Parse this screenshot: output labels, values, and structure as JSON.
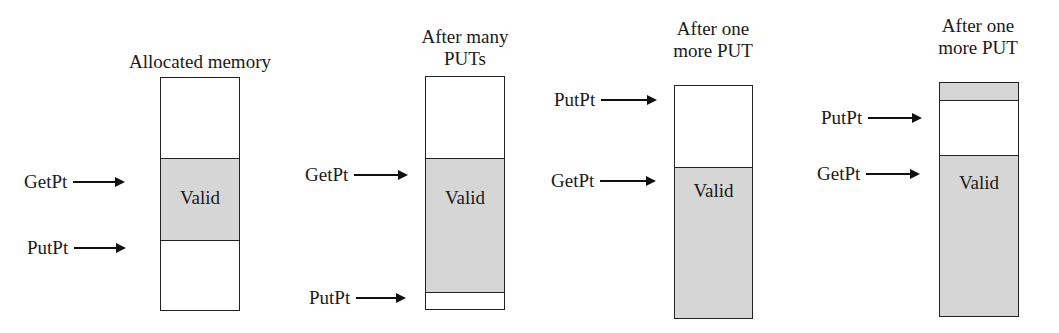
{
  "diagram": {
    "panels": [
      {
        "title": "Allocated memory",
        "segments": [
          {
            "type": "free"
          },
          {
            "type": "valid",
            "label": "Valid"
          },
          {
            "type": "free"
          }
        ],
        "pointers": [
          {
            "label": "GetPt"
          },
          {
            "label": "PutPt"
          }
        ]
      },
      {
        "title_line1": "After many",
        "title_line2": "PUTs",
        "segments": [
          {
            "type": "free"
          },
          {
            "type": "valid",
            "label": "Valid"
          },
          {
            "type": "free"
          }
        ],
        "pointers": [
          {
            "label": "GetPt"
          },
          {
            "label": "PutPt"
          }
        ]
      },
      {
        "title_line1": "After one",
        "title_line2": "more PUT",
        "segments": [
          {
            "type": "free"
          },
          {
            "type": "valid",
            "label": "Valid"
          }
        ],
        "pointers": [
          {
            "label": "PutPt"
          },
          {
            "label": "GetPt"
          }
        ]
      },
      {
        "title_line1": "After one",
        "title_line2": "more PUT",
        "segments": [
          {
            "type": "valid"
          },
          {
            "type": "free"
          },
          {
            "type": "valid",
            "label": "Valid"
          }
        ],
        "pointers": [
          {
            "label": "PutPt"
          },
          {
            "label": "GetPt"
          }
        ]
      }
    ],
    "colors": {
      "valid_fill": "#d6d6d6",
      "free_fill": "#ffffff",
      "stroke": "#222222"
    }
  }
}
